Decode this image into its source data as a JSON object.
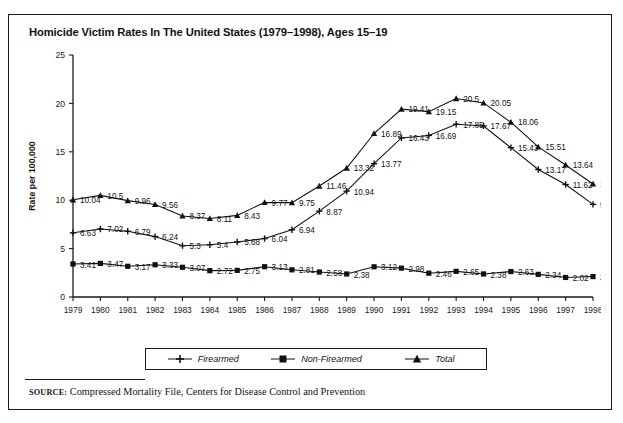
{
  "figure": {
    "title": "Homicide Victim Rates In The United States (1979–1998), Ages 15–19",
    "source_keyword": "SOURCE:",
    "source_text": " Compressed Mortality File, Centers for Disease Control and Prevention"
  },
  "legend": {
    "position": "bottom-center",
    "items": [
      {
        "label": "Firearmed",
        "marker": "plus-marker",
        "color": "#111111"
      },
      {
        "label": "Non-Firearmed",
        "marker": "square-marker",
        "color": "#111111"
      },
      {
        "label": "Total",
        "marker": "triangle-marker",
        "color": "#111111"
      }
    ]
  },
  "chart_data": {
    "type": "line",
    "title": "Homicide Victim Rates In The United States (1979–1998), Ages 15–19",
    "xlabel": "",
    "ylabel": "Rate per 100,000",
    "ylim": [
      0,
      25
    ],
    "yticks": [
      0,
      5,
      10,
      15,
      20,
      25
    ],
    "grid": false,
    "legend_position": "bottom-center",
    "categories": [
      "1979",
      "1980",
      "1981",
      "1982",
      "1983",
      "1984",
      "1985",
      "1986",
      "1987",
      "1988",
      "1989",
      "1990",
      "1991",
      "1992",
      "1993",
      "1994",
      "1995",
      "1996",
      "1997",
      "1998"
    ],
    "series": [
      {
        "name": "Firearmed",
        "marker": "plus-marker",
        "values": [
          6.63,
          7.02,
          6.79,
          6.24,
          5.3,
          5.4,
          5.68,
          6.04,
          6.94,
          8.87,
          10.94,
          13.77,
          16.43,
          16.69,
          17.85,
          17.67,
          15.43,
          13.17,
          11.62,
          9.57
        ]
      },
      {
        "name": "Non-Firearmed",
        "marker": "square-marker",
        "values": [
          3.41,
          3.47,
          3.17,
          3.33,
          3.07,
          2.72,
          2.75,
          3.13,
          2.81,
          2.58,
          2.38,
          3.12,
          2.98,
          2.46,
          2.65,
          2.38,
          2.63,
          2.34,
          2.02,
          2.11
        ]
      },
      {
        "name": "Total",
        "marker": "triangle-marker",
        "values": [
          10.04,
          10.5,
          9.96,
          9.56,
          8.37,
          8.11,
          8.43,
          9.77,
          9.75,
          11.46,
          13.32,
          16.89,
          19.41,
          19.15,
          20.5,
          20.05,
          18.06,
          15.51,
          13.64,
          11.68
        ]
      }
    ]
  }
}
